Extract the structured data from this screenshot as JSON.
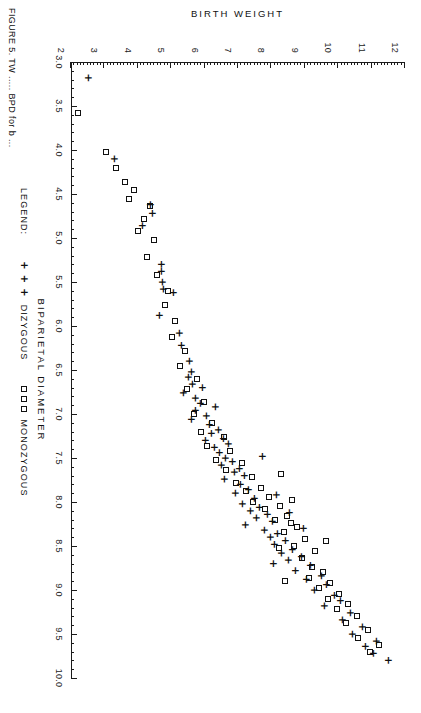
{
  "figure": {
    "caption": "FIGURE 5.  TW ..... BPD for b ...",
    "legend_title": "LEGEND:",
    "orientation_note": "rotated"
  },
  "chart_data": {
    "type": "scatter",
    "title": "",
    "xlabel": "BIPARIETAL DIAMETER",
    "ylabel": "BIRTH WEIGHT",
    "xlim": [
      3.0,
      10.0
    ],
    "ylim": [
      2,
      12
    ],
    "grid": false,
    "legend_position": "below-axis",
    "x_ticks": [
      "3.0",
      "3.5",
      "4.0",
      "4.5",
      "5.0",
      "5.5",
      "6.0",
      "6.5",
      "7.0",
      "7.5",
      "8.0",
      "8.5",
      "9.0",
      "9.5",
      "10.0"
    ],
    "x_tick_step": 0.5,
    "x_minor_step": 0.1,
    "y_ticks": [
      "2",
      "3",
      "4",
      "5",
      "6",
      "7",
      "8",
      "9",
      "10",
      "11",
      "12"
    ],
    "y_tick_step": 1,
    "y_minor_step": 0.1,
    "series": [
      {
        "name": "DIZYGOUS",
        "marker": "plus",
        "marker_glyph": "+",
        "color": "#111111",
        "points": [
          [
            3.18,
            2.52
          ],
          [
            4.1,
            3.28
          ],
          [
            4.62,
            4.38
          ],
          [
            4.72,
            4.42
          ],
          [
            4.86,
            4.12
          ],
          [
            5.3,
            4.68
          ],
          [
            5.38,
            4.7
          ],
          [
            5.5,
            4.72
          ],
          [
            5.58,
            4.74
          ],
          [
            5.62,
            5.05
          ],
          [
            5.88,
            4.62
          ],
          [
            6.08,
            5.22
          ],
          [
            6.22,
            5.3
          ],
          [
            6.4,
            5.52
          ],
          [
            6.52,
            5.6
          ],
          [
            6.58,
            5.5
          ],
          [
            6.66,
            5.62
          ],
          [
            6.7,
            5.92
          ],
          [
            6.76,
            5.35
          ],
          [
            6.82,
            5.7
          ],
          [
            6.88,
            5.85
          ],
          [
            6.92,
            6.3
          ],
          [
            6.96,
            5.72
          ],
          [
            7.02,
            6.05
          ],
          [
            7.06,
            5.58
          ],
          [
            7.12,
            6.12
          ],
          [
            7.18,
            6.4
          ],
          [
            7.22,
            6.18
          ],
          [
            7.28,
            6.55
          ],
          [
            7.3,
            6.02
          ],
          [
            7.34,
            6.7
          ],
          [
            7.38,
            6.28
          ],
          [
            7.44,
            6.42
          ],
          [
            7.5,
            6.62
          ],
          [
            7.54,
            6.82
          ],
          [
            7.58,
            6.48
          ],
          [
            7.62,
            7.02
          ],
          [
            7.66,
            6.88
          ],
          [
            7.7,
            7.18
          ],
          [
            7.74,
            6.58
          ],
          [
            7.8,
            7.05
          ],
          [
            7.86,
            7.3
          ],
          [
            7.9,
            6.92
          ],
          [
            7.96,
            7.48
          ],
          [
            8.02,
            7.12
          ],
          [
            8.06,
            7.62
          ],
          [
            8.1,
            7.35
          ],
          [
            8.14,
            7.88
          ],
          [
            8.18,
            7.55
          ],
          [
            8.22,
            8.02
          ],
          [
            8.26,
            7.22
          ],
          [
            8.32,
            7.78
          ],
          [
            8.36,
            8.18
          ],
          [
            8.4,
            7.95
          ],
          [
            8.44,
            8.42
          ],
          [
            8.48,
            8.08
          ],
          [
            8.54,
            8.62
          ],
          [
            8.58,
            8.3
          ],
          [
            8.62,
            8.88
          ],
          [
            8.66,
            8.5
          ],
          [
            8.72,
            9.15
          ],
          [
            8.78,
            8.72
          ],
          [
            8.84,
            9.48
          ],
          [
            8.88,
            9.05
          ],
          [
            8.94,
            9.62
          ],
          [
            9.0,
            9.28
          ],
          [
            9.06,
            9.88
          ],
          [
            9.12,
            10.05
          ],
          [
            9.18,
            9.58
          ],
          [
            9.26,
            10.35
          ],
          [
            9.34,
            10.12
          ],
          [
            9.42,
            10.72
          ],
          [
            9.5,
            10.42
          ],
          [
            9.58,
            11.12
          ],
          [
            9.64,
            10.8
          ],
          [
            9.72,
            11.05
          ],
          [
            9.8,
            11.48
          ],
          [
            8.3,
            8.95
          ],
          [
            7.92,
            8.15
          ],
          [
            8.7,
            8.05
          ],
          [
            8.12,
            8.52
          ],
          [
            7.48,
            7.72
          ]
        ]
      },
      {
        "name": "MONOZYGOUS",
        "marker": "square",
        "marker_glyph": "□",
        "color": "#111111",
        "points": [
          [
            3.58,
            2.22
          ],
          [
            4.02,
            3.05
          ],
          [
            4.2,
            3.35
          ],
          [
            4.36,
            3.62
          ],
          [
            4.46,
            3.88
          ],
          [
            4.56,
            3.75
          ],
          [
            4.64,
            4.38
          ],
          [
            4.78,
            4.18
          ],
          [
            4.92,
            4.02
          ],
          [
            5.02,
            4.48
          ],
          [
            5.22,
            4.28
          ],
          [
            5.42,
            4.58
          ],
          [
            5.6,
            4.9
          ],
          [
            5.76,
            4.82
          ],
          [
            5.94,
            5.12
          ],
          [
            6.12,
            5.02
          ],
          [
            6.28,
            5.42
          ],
          [
            6.46,
            5.26
          ],
          [
            6.6,
            5.78
          ],
          [
            6.72,
            5.48
          ],
          [
            6.86,
            5.98
          ],
          [
            7.0,
            5.68
          ],
          [
            7.1,
            6.22
          ],
          [
            7.2,
            5.88
          ],
          [
            7.26,
            6.58
          ],
          [
            7.36,
            6.08
          ],
          [
            7.42,
            6.75
          ],
          [
            7.52,
            6.35
          ],
          [
            7.56,
            7.12
          ],
          [
            7.64,
            6.65
          ],
          [
            7.72,
            7.42
          ],
          [
            7.78,
            6.95
          ],
          [
            7.84,
            7.68
          ],
          [
            7.88,
            7.25
          ],
          [
            7.94,
            7.92
          ],
          [
            8.0,
            7.45
          ],
          [
            8.04,
            8.25
          ],
          [
            8.08,
            7.82
          ],
          [
            8.16,
            8.48
          ],
          [
            8.2,
            8.12
          ],
          [
            8.28,
            8.78
          ],
          [
            8.34,
            8.38
          ],
          [
            8.42,
            9.02
          ],
          [
            8.5,
            8.68
          ],
          [
            8.56,
            9.32
          ],
          [
            8.64,
            8.92
          ],
          [
            8.74,
            9.22
          ],
          [
            8.8,
            9.55
          ],
          [
            8.86,
            9.12
          ],
          [
            8.92,
            9.75
          ],
          [
            8.98,
            9.42
          ],
          [
            9.04,
            10.02
          ],
          [
            9.1,
            9.68
          ],
          [
            9.16,
            10.28
          ],
          [
            9.22,
            9.95
          ],
          [
            9.3,
            10.55
          ],
          [
            9.38,
            10.22
          ],
          [
            9.46,
            10.88
          ],
          [
            9.54,
            10.58
          ],
          [
            9.62,
            11.22
          ],
          [
            9.7,
            10.95
          ],
          [
            8.24,
            8.58
          ],
          [
            7.98,
            8.62
          ],
          [
            7.68,
            8.28
          ],
          [
            8.44,
            9.62
          ],
          [
            8.52,
            8.22
          ],
          [
            8.9,
            8.42
          ]
        ]
      }
    ]
  }
}
